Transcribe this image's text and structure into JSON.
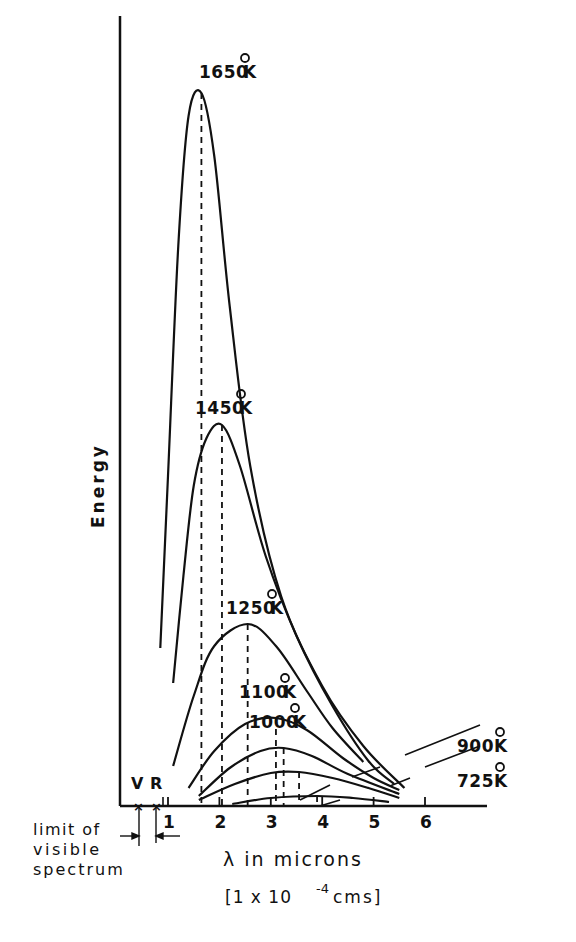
{
  "chart_data": {
    "type": "line",
    "title": "",
    "xlabel": "λ in microns",
    "xlabel_units": "[1 x 10^-4 cms]",
    "xlabel_units_parts": {
      "open": "[1 x 10",
      "exp": "-4",
      "close": " cms]"
    },
    "ylabel": "Energy",
    "x_ticks": [
      1,
      2,
      3,
      4,
      5,
      6
    ],
    "xlim": [
      0,
      7.3
    ],
    "ylim": [
      0,
      790
    ],
    "y_ticks": [],
    "grid": false,
    "legend": "none",
    "annotations": {
      "visible_markers": [
        {
          "label": "V",
          "x": 0.38
        },
        {
          "label": "R",
          "x": 0.78
        }
      ],
      "visible_limit_text": [
        "limit of",
        "visible",
        "spectrum"
      ],
      "peak_dashed_lines": true
    },
    "series": [
      {
        "name": "1650°K",
        "temp": "1650",
        "peak_x": 1.65,
        "peak_y": 713,
        "points": [
          [
            0.85,
            158
          ],
          [
            1.0,
            330
          ],
          [
            1.2,
            560
          ],
          [
            1.4,
            690
          ],
          [
            1.65,
            713
          ],
          [
            1.9,
            650
          ],
          [
            2.2,
            500
          ],
          [
            2.6,
            340
          ],
          [
            3.2,
            210
          ],
          [
            4.0,
            120
          ],
          [
            4.8,
            60
          ],
          [
            5.6,
            18
          ]
        ],
        "label_pos": [
          232,
          78
        ]
      },
      {
        "name": "1450°K",
        "temp": "1450",
        "peak_x": 2.05,
        "peak_y": 381,
        "points": [
          [
            1.1,
            123
          ],
          [
            1.3,
            230
          ],
          [
            1.5,
            320
          ],
          [
            1.75,
            368
          ],
          [
            2.05,
            381
          ],
          [
            2.4,
            340
          ],
          [
            2.9,
            250
          ],
          [
            3.5,
            170
          ],
          [
            4.2,
            100
          ],
          [
            4.9,
            45
          ],
          [
            5.4,
            22
          ]
        ],
        "label_pos": [
          228,
          414
        ]
      },
      {
        "name": "1250°K",
        "temp": "1250",
        "peak_x": 2.55,
        "peak_y": 182,
        "points": [
          [
            1.1,
            40
          ],
          [
            1.5,
            110
          ],
          [
            1.9,
            160
          ],
          [
            2.55,
            182
          ],
          [
            3.1,
            160
          ],
          [
            3.7,
            115
          ],
          [
            4.2,
            78
          ],
          [
            4.8,
            44
          ]
        ],
        "label_pos": [
          259,
          614
        ]
      },
      {
        "name": "1100°K",
        "temp": "1100",
        "peak_x": 3.1,
        "peak_y": 88,
        "points": [
          [
            1.4,
            18
          ],
          [
            1.9,
            55
          ],
          [
            2.5,
            82
          ],
          [
            3.1,
            88
          ],
          [
            3.7,
            76
          ],
          [
            4.4,
            48
          ],
          [
            5.0,
            28
          ],
          [
            5.5,
            16
          ]
        ],
        "label_pos": [
          272,
          698
        ]
      },
      {
        "name": "1000°K",
        "temp": "1000",
        "peak_x": 3.25,
        "peak_y": 58,
        "points": [
          [
            1.6,
            10
          ],
          [
            2.2,
            38
          ],
          [
            2.8,
            55
          ],
          [
            3.25,
            58
          ],
          [
            3.8,
            50
          ],
          [
            4.5,
            32
          ],
          [
            5.5,
            12
          ]
        ],
        "label_pos": [
          282,
          728
        ]
      },
      {
        "name": "900°K",
        "temp": "900",
        "peak_x": 3.55,
        "peak_y": 34,
        "points": [
          [
            1.6,
            6
          ],
          [
            2.3,
            22
          ],
          [
            3.0,
            33
          ],
          [
            3.55,
            34
          ],
          [
            4.2,
            28
          ],
          [
            4.9,
            18
          ],
          [
            5.5,
            8
          ]
        ],
        "label_pos": [
          490,
          752
        ]
      },
      {
        "name": "725°K",
        "temp": "725",
        "peak_x": 3.9,
        "peak_y": 10,
        "points": [
          [
            2.25,
            2
          ],
          [
            3.0,
            8
          ],
          [
            3.9,
            10
          ],
          [
            4.6,
            8
          ],
          [
            5.3,
            4
          ]
        ],
        "label_pos": [
          490,
          787
        ]
      }
    ]
  },
  "labels": {
    "ylabel": "Energy",
    "xlabel": "λ in microns",
    "units_open": "[1 x 10",
    "units_exp": "-4",
    "units_close": " cms]",
    "v_marker": "V",
    "r_marker": "R",
    "limit_line1": "limit of",
    "limit_line2": "visible",
    "limit_line3": "spectrum",
    "degree": "o",
    "kelvin": "K"
  }
}
